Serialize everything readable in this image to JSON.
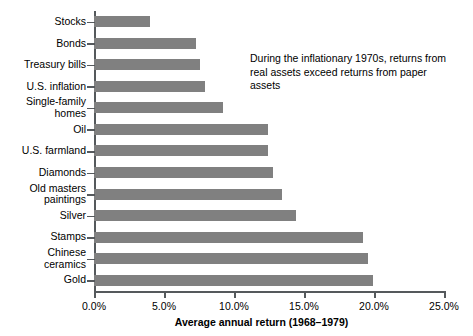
{
  "chart_data": {
    "type": "bar",
    "orientation": "horizontal",
    "title": "",
    "xlabel": "Average annual return (1968–1979)",
    "ylabel": "",
    "xlim": [
      0,
      25
    ],
    "xtick_labels": [
      "0.0%",
      "5.0%",
      "10.0%",
      "15.0%",
      "20.0%",
      "25.0%"
    ],
    "xticks": [
      0,
      5,
      10,
      15,
      20,
      25
    ],
    "grid": false,
    "legend": null,
    "bar_color": "#808080",
    "axis_color": "#55595c",
    "categories": [
      "Stocks",
      "Bonds",
      "Treasury bills",
      "U.S. inflation",
      "Single-family\nhomes",
      "Oil",
      "U.S. farmland",
      "Diamonds",
      "Old masters\npaintings",
      "Silver",
      "Stamps",
      "Chinese\nceramics",
      "Gold"
    ],
    "values": [
      4.0,
      7.3,
      7.6,
      7.9,
      9.2,
      12.4,
      12.4,
      12.8,
      13.4,
      14.4,
      19.2,
      19.6,
      19.9
    ],
    "annotations": [
      {
        "text": "During the inflationary 1970s, returns from real assets exceed returns from paper assets"
      }
    ]
  }
}
